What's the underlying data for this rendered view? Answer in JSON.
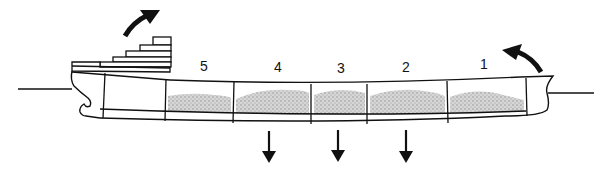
{
  "diagram": {
    "type": "ship-hull-loading",
    "colors": {
      "line": "#111111",
      "cargo": "#bdbdbd",
      "background": "#ffffff"
    },
    "holds": [
      {
        "label": "5"
      },
      {
        "label": "4"
      },
      {
        "label": "3"
      },
      {
        "label": "2"
      },
      {
        "label": "1"
      }
    ],
    "arrows": {
      "stern": "curved-up-arrow",
      "bow": "curved-up-arrow",
      "midship": [
        "down-arrow",
        "down-arrow",
        "down-arrow"
      ]
    }
  }
}
